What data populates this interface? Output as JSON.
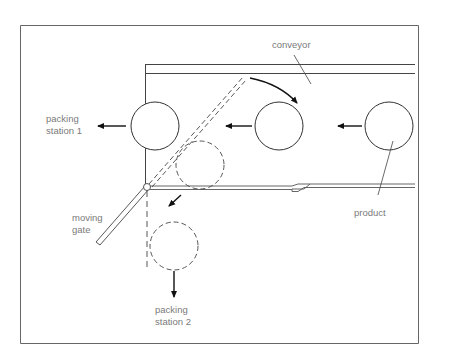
{
  "diagram": {
    "labels": {
      "conveyor": "conveyor",
      "packing_station_1_line1": "packing",
      "packing_station_1_line2": "station 1",
      "packing_station_2_line1": "packing",
      "packing_station_2_line2": "station 2",
      "moving_gate_line1": "moving",
      "moving_gate_line2": "gate",
      "product": "product"
    },
    "nodes": [
      {
        "id": "product-right",
        "kind": "product",
        "style": "solid"
      },
      {
        "id": "product-middle",
        "kind": "product",
        "style": "solid"
      },
      {
        "id": "product-station1",
        "kind": "product",
        "style": "solid"
      },
      {
        "id": "product-diverting",
        "kind": "product",
        "style": "dashed"
      },
      {
        "id": "product-station2",
        "kind": "product",
        "style": "dashed"
      }
    ],
    "edges": [
      {
        "from": "product-right",
        "to": "product-middle",
        "label": "flow"
      },
      {
        "from": "product-middle",
        "to": "product-station1",
        "label": "flow"
      },
      {
        "from": "product-station1",
        "to": "packing station 1"
      },
      {
        "from": "product-diverting",
        "to": "product-station2"
      },
      {
        "from": "product-station2",
        "to": "packing station 2"
      },
      {
        "from": "moving gate",
        "to": "gate swing position",
        "style": "curved"
      }
    ],
    "colors": {
      "line": "#333333",
      "frame": "#555555",
      "text": "#7a7a7a"
    }
  }
}
